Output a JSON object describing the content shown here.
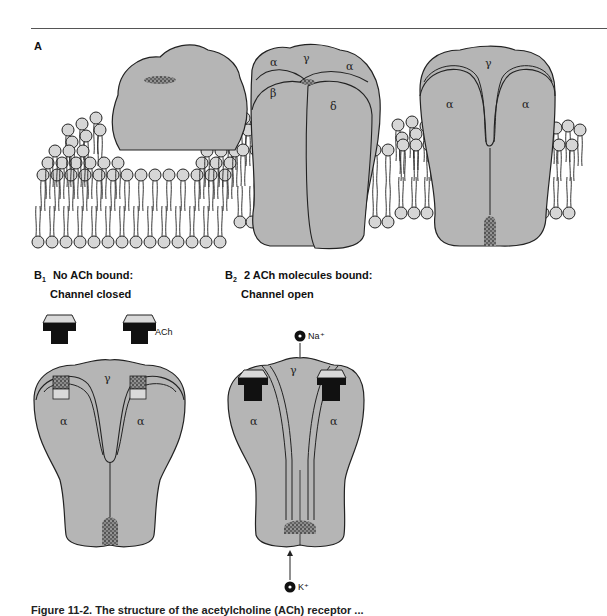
{
  "figure": {
    "panels": {
      "A": {
        "label": "A"
      },
      "B1": {
        "label": "B",
        "subscript": "1",
        "title_line1": "No ACh bound:",
        "title_line2": "Channel closed"
      },
      "B2": {
        "label": "B",
        "subscript": "2",
        "title_line1": "2 ACh molecules bound:",
        "title_line2": "Channel open"
      }
    },
    "subunit_labels": {
      "alpha": "α",
      "beta": "β",
      "gamma": "γ",
      "delta": "δ"
    },
    "ligand_label": "ACh",
    "ions": {
      "sodium": "Na⁺",
      "potassium": "K⁺"
    },
    "caption": "Figure 11-2. The structure of the acetylcholine (ACh) receptor ...",
    "colors": {
      "protein_fill": "#b5b5b5",
      "outline": "#222222",
      "lipid_head": "#d6d6d6",
      "ach_body": "#111111",
      "ach_cap": "#d9d9d9"
    }
  }
}
